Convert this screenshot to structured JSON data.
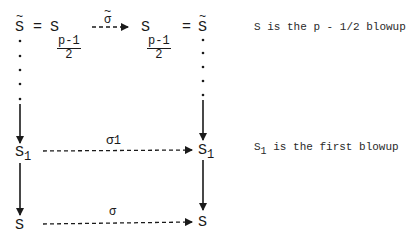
{
  "diagram": {
    "top_row": {
      "left_symbol": "S",
      "left_tilde": "~",
      "equals_1": "=",
      "s_left": "S",
      "frac_left_num": "p-1",
      "frac_left_den": "2",
      "top_arrow_label": "σ",
      "top_arrow_tilde": "~",
      "s_right": "S",
      "frac_right_num": "p-1",
      "frac_right_den": "2",
      "equals_2": "=",
      "right_symbol": "S",
      "right_tilde": "~"
    },
    "middle_row": {
      "left_symbol": "S",
      "left_sub": "1",
      "arrow_label": "σ",
      "arrow_label_sub": "1",
      "right_symbol": "S",
      "right_sub": "1"
    },
    "bottom_row": {
      "left_symbol": "S",
      "arrow_label": "σ",
      "right_symbol": "S"
    },
    "annotations": {
      "top": "S is the p - 1/2 blowup",
      "middle_symbol": "S",
      "middle_sub": "1",
      "middle_text": " is the first blowup"
    }
  },
  "colors": {
    "ink": "#1a1a1a",
    "background": "#ffffff"
  }
}
